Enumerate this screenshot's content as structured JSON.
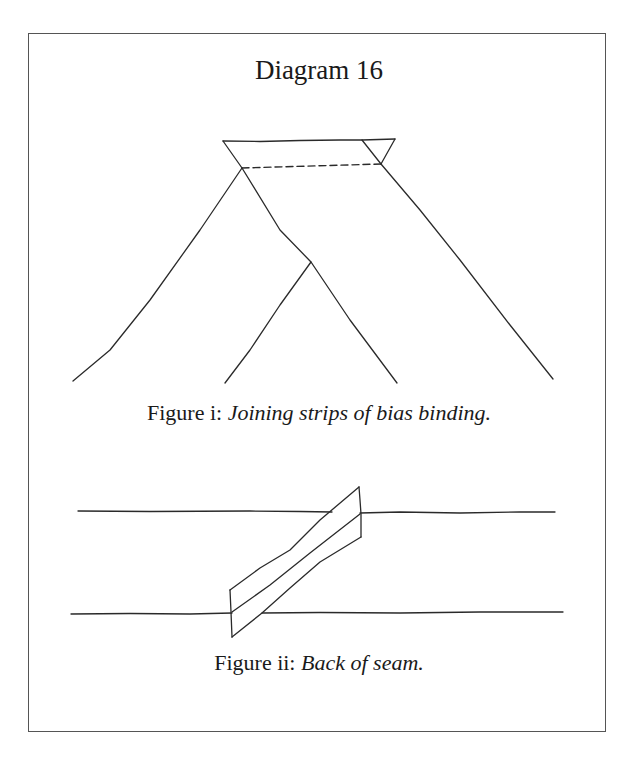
{
  "diagram": {
    "title": "Diagram 16",
    "figures": [
      {
        "id": "i",
        "label": "Figure i:",
        "description": "Joining strips of bias binding."
      },
      {
        "id": "ii",
        "label": "Figure ii:",
        "description": "Back of seam."
      }
    ]
  }
}
